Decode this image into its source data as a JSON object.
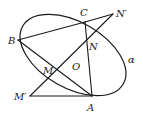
{
  "diagram": {
    "plane_label": "α",
    "points": {
      "A": {
        "label": "A",
        "x": 92,
        "y": 96
      },
      "B": {
        "label": "B",
        "x": 18,
        "y": 40
      },
      "C": {
        "label": "C",
        "x": 85,
        "y": 22
      },
      "N": {
        "label": "N",
        "x": 88,
        "y": 39
      },
      "N_prime": {
        "label": "N′",
        "x": 113,
        "y": 14
      },
      "M": {
        "label": "M",
        "x": 52,
        "y": 71
      },
      "M_prime": {
        "label": "M′",
        "x": 30,
        "y": 96
      },
      "O": {
        "label": "O",
        "x": 71,
        "y": 60
      }
    },
    "segments": [
      {
        "from": "B",
        "to": "C"
      },
      {
        "from": "B",
        "to": "A"
      },
      {
        "from": "C",
        "to": "A"
      },
      {
        "from": "C",
        "to": "N_prime"
      },
      {
        "from": "N_prime",
        "to": "M_prime"
      },
      {
        "from": "M_prime",
        "to": "A"
      }
    ],
    "ellipse": {
      "cx": 73,
      "cy": 55,
      "rx": 58,
      "ry": 34,
      "rotation": 32
    }
  }
}
